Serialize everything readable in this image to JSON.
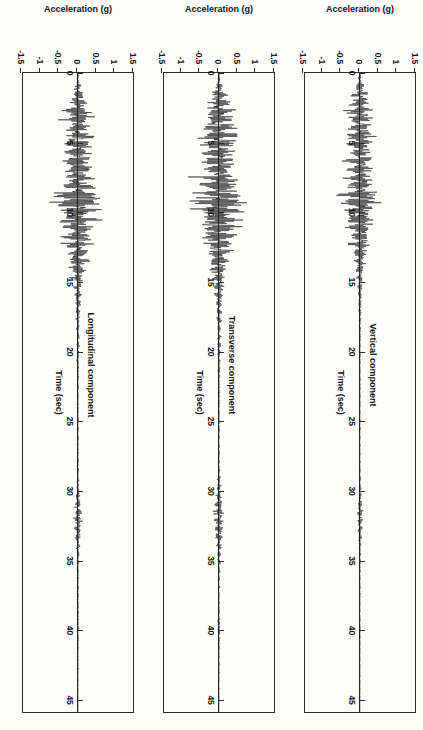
{
  "figure": {
    "name": "three-component-accelerogram",
    "orientation": "rotated-90-ccw",
    "background_color": "#fcfcfb",
    "ink_color": "#1e1e1e"
  },
  "chart_data": [
    {
      "type": "line",
      "panel_index": 0,
      "title": "Longitudinal component",
      "xlabel": "Time (sec)",
      "ylabel": "Acceleration (g)",
      "xlim": [
        0,
        46
      ],
      "ylim": [
        -1.5,
        1.5
      ],
      "xticks": [
        0,
        5,
        10,
        15,
        20,
        25,
        30,
        35,
        40,
        45
      ],
      "xtick_labels": [
        "0",
        "5",
        "10",
        "15",
        "20",
        "25",
        "30",
        "35",
        "40",
        "45"
      ],
      "yticks": [
        1.5,
        1,
        0.5,
        0,
        -0.5,
        -1,
        -1.5
      ],
      "ytick_labels": [
        "1.5",
        "1",
        "0.5",
        "0",
        "-0.5",
        "-1",
        "-1.5"
      ],
      "grid": false,
      "legend": "none",
      "peak_acceleration_g": 1.0,
      "strong_motion_window_sec": [
        1.5,
        14.0
      ],
      "envelope": {
        "x": [
          0,
          0.6,
          1.2,
          1.8,
          2.4,
          3.0,
          3.6,
          4.2,
          4.8,
          5.4,
          6.0,
          6.6,
          7.2,
          7.8,
          8.4,
          9.0,
          9.6,
          10.2,
          10.8,
          11.4,
          12.0,
          12.6,
          13.2,
          13.8,
          14.4,
          15.0,
          16,
          17,
          18,
          19,
          20,
          22,
          24,
          26,
          28,
          30,
          31,
          32,
          33,
          34,
          35,
          36,
          38,
          40,
          42,
          44,
          46
        ],
        "y": [
          0.01,
          0.05,
          0.14,
          0.22,
          0.3,
          0.52,
          0.42,
          0.38,
          0.62,
          0.48,
          0.4,
          0.52,
          0.44,
          0.58,
          0.5,
          0.96,
          0.72,
          0.62,
          0.7,
          0.48,
          0.56,
          0.4,
          0.34,
          0.28,
          0.22,
          0.16,
          0.11,
          0.08,
          0.06,
          0.05,
          0.04,
          0.03,
          0.025,
          0.02,
          0.02,
          0.05,
          0.09,
          0.14,
          0.1,
          0.06,
          0.04,
          0.03,
          0.02,
          0.03,
          0.015,
          0.01,
          0.005
        ]
      }
    },
    {
      "type": "line",
      "panel_index": 1,
      "title": "Transverse component",
      "xlabel": "Time (sec)",
      "ylabel": "Acceleration (g)",
      "xlim": [
        0,
        46
      ],
      "ylim": [
        -1.5,
        1.5
      ],
      "xticks": [
        0,
        5,
        10,
        15,
        20,
        25,
        30,
        35,
        40,
        45
      ],
      "xtick_labels": [
        "0",
        "5",
        "10",
        "15",
        "20",
        "25",
        "30",
        "35",
        "40",
        "45"
      ],
      "yticks": [
        1.5,
        1,
        0.5,
        0,
        -0.5,
        -1,
        -1.5
      ],
      "ytick_labels": [
        "1.5",
        "1",
        "0.5",
        "0",
        "-0.5",
        "-1",
        "-1.5"
      ],
      "grid": false,
      "legend": "none",
      "peak_acceleration_g": 1.2,
      "strong_motion_window_sec": [
        1.5,
        14.5
      ],
      "envelope": {
        "x": [
          0,
          0.6,
          1.2,
          1.8,
          2.4,
          3.0,
          3.6,
          4.2,
          4.8,
          5.4,
          6.0,
          6.6,
          7.2,
          7.8,
          8.4,
          9.0,
          9.6,
          10.2,
          10.8,
          11.4,
          12.0,
          12.6,
          13.2,
          13.8,
          14.4,
          15.0,
          16,
          17,
          18,
          19,
          20,
          22,
          24,
          26,
          28,
          30,
          31,
          32,
          33,
          34,
          35,
          36,
          38,
          40,
          42,
          44,
          46
        ],
        "y": [
          0.01,
          0.06,
          0.18,
          0.3,
          0.44,
          0.58,
          0.5,
          0.6,
          0.72,
          0.54,
          0.48,
          0.66,
          0.56,
          0.7,
          0.64,
          1.18,
          0.76,
          0.68,
          0.8,
          0.56,
          0.62,
          0.46,
          0.38,
          0.3,
          0.24,
          0.18,
          0.13,
          0.1,
          0.07,
          0.06,
          0.05,
          0.035,
          0.03,
          0.025,
          0.025,
          0.07,
          0.13,
          0.19,
          0.14,
          0.08,
          0.05,
          0.035,
          0.025,
          0.04,
          0.02,
          0.012,
          0.006
        ]
      }
    },
    {
      "type": "line",
      "panel_index": 2,
      "title": "Vertical component",
      "xlabel": "Time (sec)",
      "ylabel": "Acceleration (g)",
      "xlim": [
        0,
        46
      ],
      "ylim": [
        -1.5,
        1.5
      ],
      "xticks": [
        0,
        5,
        10,
        15,
        20,
        25,
        30,
        35,
        40,
        45
      ],
      "xtick_labels": [
        "0",
        "5",
        "10",
        "15",
        "20",
        "25",
        "30",
        "35",
        "40",
        "45"
      ],
      "yticks": [
        1.5,
        1,
        0.5,
        0,
        -0.5,
        -1,
        -1.5
      ],
      "ytick_labels": [
        "1.5",
        "1",
        "0.5",
        "0",
        "-0.5",
        "-1",
        "-1.5"
      ],
      "grid": false,
      "legend": "none",
      "peak_acceleration_g": 0.75,
      "strong_motion_window_sec": [
        1.0,
        13.0
      ],
      "envelope": {
        "x": [
          0,
          0.6,
          1.2,
          1.8,
          2.4,
          3.0,
          3.6,
          4.2,
          4.8,
          5.4,
          6.0,
          6.6,
          7.2,
          7.8,
          8.4,
          9.0,
          9.6,
          10.2,
          10.8,
          11.4,
          12.0,
          12.6,
          13.2,
          13.8,
          14.4,
          15.0,
          16,
          17,
          18,
          19,
          20,
          22,
          24,
          26,
          28,
          30,
          31,
          32,
          33,
          34,
          35,
          36,
          38,
          40,
          42,
          44,
          46
        ],
        "y": [
          0.01,
          0.08,
          0.22,
          0.34,
          0.4,
          0.46,
          0.38,
          0.44,
          0.5,
          0.4,
          0.36,
          0.46,
          0.38,
          0.48,
          0.42,
          0.74,
          0.5,
          0.44,
          0.46,
          0.34,
          0.36,
          0.26,
          0.21,
          0.16,
          0.12,
          0.09,
          0.07,
          0.05,
          0.04,
          0.03,
          0.025,
          0.02,
          0.018,
          0.015,
          0.015,
          0.04,
          0.07,
          0.1,
          0.07,
          0.04,
          0.03,
          0.02,
          0.015,
          0.02,
          0.01,
          0.008,
          0.004
        ]
      }
    }
  ]
}
